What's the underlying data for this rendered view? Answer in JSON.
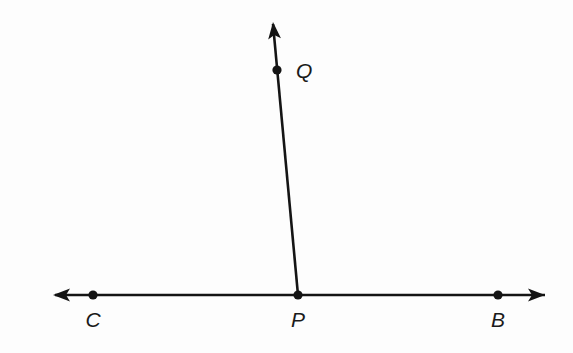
{
  "figure": {
    "background_color": "#fdfdfd",
    "stroke_color": "#141414",
    "line_width": 2.6,
    "dot_radius": 4.6,
    "points": [
      {
        "id": "C",
        "label": "C",
        "x": 93,
        "y": 295,
        "label_x": 93,
        "label_y": 327
      },
      {
        "id": "P",
        "label": "P",
        "x": 298,
        "y": 295,
        "label_x": 298,
        "label_y": 327
      },
      {
        "id": "B",
        "label": "B",
        "x": 498,
        "y": 295,
        "label_x": 498,
        "label_y": 327
      },
      {
        "id": "Q",
        "label": "Q",
        "x": 277,
        "y": 70,
        "label_x": 296,
        "label_y": 78
      }
    ],
    "segments": [
      {
        "id": "line-CB",
        "x1": 55,
        "y1": 295,
        "x2": 545,
        "y2": 295
      },
      {
        "id": "ray-PQ",
        "x1": 298,
        "y1": 295,
        "x2": 273,
        "y2": 24
      }
    ],
    "arrowheads": [
      {
        "id": "arrow-left",
        "tip_x": 53,
        "tip_y": 295,
        "angle": 180
      },
      {
        "id": "arrow-right",
        "tip_x": 545,
        "tip_y": 295,
        "angle": 0
      },
      {
        "id": "arrow-up",
        "tip_x": 273,
        "tip_y": 22,
        "angle": -95.3
      }
    ]
  }
}
